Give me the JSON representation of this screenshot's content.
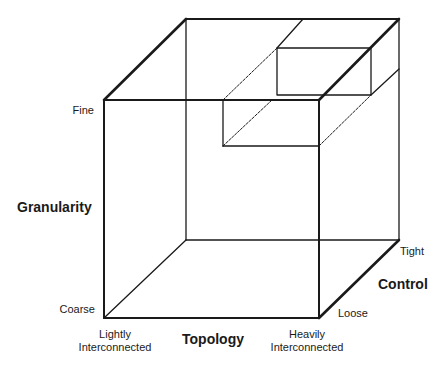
{
  "diagram": {
    "type": "3d-cube",
    "axes": {
      "granularity": {
        "label": "Granularity",
        "low": "Coarse",
        "high": "Fine"
      },
      "topology": {
        "label": "Topology",
        "low": "Lightly\nInterconnected",
        "low_line1": "Lightly",
        "low_line2": "Interconnected",
        "high_line1": "Heavily",
        "high_line2": "Interconnected"
      },
      "control": {
        "label": "Control",
        "low": "Loose",
        "high": "Tight"
      }
    },
    "colors": {
      "line": "#1a1a1a",
      "background": "#ffffff"
    }
  }
}
